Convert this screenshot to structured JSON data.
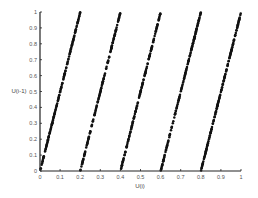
{
  "chart_data": {
    "type": "scatter",
    "title": "",
    "xlabel": "U(i)",
    "ylabel": "U(i-1)",
    "xlim": [
      0,
      1
    ],
    "ylim": [
      0,
      1
    ],
    "xticks": [
      "0",
      "0.1",
      "0.2",
      "0.3",
      "0.4",
      "0.5",
      "0.6",
      "0.7",
      "0.8",
      "0.9",
      "1"
    ],
    "yticks": [
      "0",
      "0.1",
      "0.2",
      "0.3",
      "0.4",
      "0.5",
      "0.6",
      "0.7",
      "0.8",
      "0.9",
      "1"
    ],
    "grid": false,
    "legend": null,
    "marker_color": "#111111",
    "series": [
      {
        "name": "successive pairs (U(i), U(i-1))",
        "description": "Approximately 750 points uniformly filling the unit square, arranged along short diagonal lattice lines (descending left-to-right), typical of a linear congruential generator serial-correlation plot.",
        "generator": {
          "modulus": 2048,
          "multiplier": 1229,
          "increment": 1,
          "seed": 7,
          "count": 760
        }
      }
    ]
  },
  "labels": {
    "x_axis": "U(i)",
    "y_axis": "U(i-1)"
  }
}
